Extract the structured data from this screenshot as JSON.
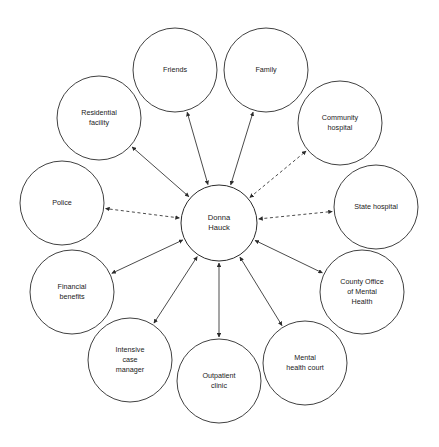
{
  "diagram": {
    "type": "ecomap",
    "center": {
      "id": "center",
      "lines": [
        "Donna",
        "Hauck"
      ],
      "cx": 219,
      "cy": 223,
      "r": 38
    },
    "nodes": [
      {
        "id": "friends",
        "lines": [
          "Friends"
        ],
        "cx": 175,
        "cy": 70,
        "r": 42
      },
      {
        "id": "family",
        "lines": [
          "Family"
        ],
        "cx": 266,
        "cy": 70,
        "r": 42
      },
      {
        "id": "residential",
        "lines": [
          "Residential",
          "facility"
        ],
        "cx": 99,
        "cy": 118,
        "r": 42
      },
      {
        "id": "community_hosp",
        "lines": [
          "Community",
          "hospital"
        ],
        "cx": 340,
        "cy": 123,
        "r": 42
      },
      {
        "id": "police",
        "lines": [
          "Police"
        ],
        "cx": 62,
        "cy": 203,
        "r": 42
      },
      {
        "id": "state_hosp",
        "lines": [
          "State hospital"
        ],
        "cx": 376,
        "cy": 207,
        "r": 42
      },
      {
        "id": "financial",
        "lines": [
          "Financial",
          "benefits"
        ],
        "cx": 72,
        "cy": 292,
        "r": 42
      },
      {
        "id": "county_office",
        "lines": [
          "County Office",
          "of Mental",
          "Health"
        ],
        "cx": 362,
        "cy": 292,
        "r": 42
      },
      {
        "id": "icm",
        "lines": [
          "Intensive",
          "case",
          "manager"
        ],
        "cx": 130,
        "cy": 360,
        "r": 42
      },
      {
        "id": "outpatient",
        "lines": [
          "Outpatient",
          "clinic"
        ],
        "cx": 219,
        "cy": 381,
        "r": 42
      },
      {
        "id": "mh_court",
        "lines": [
          "Mental",
          "health court"
        ],
        "cx": 305,
        "cy": 363,
        "r": 42
      }
    ],
    "links": [
      {
        "id": "link-friends",
        "from": "center",
        "to": "friends",
        "style": "solid",
        "arrows": "both"
      },
      {
        "id": "link-family",
        "from": "center",
        "to": "family",
        "style": "solid",
        "arrows": "both"
      },
      {
        "id": "link-residential",
        "from": "center",
        "to": "residential",
        "style": "solid",
        "arrows": "both"
      },
      {
        "id": "link-community-hosp",
        "from": "center",
        "to": "community_hosp",
        "style": "dashed",
        "arrows": "both"
      },
      {
        "id": "link-police",
        "from": "center",
        "to": "police",
        "style": "dashed",
        "arrows": "both"
      },
      {
        "id": "link-state-hosp",
        "from": "center",
        "to": "state_hosp",
        "style": "dashed",
        "arrows": "both"
      },
      {
        "id": "link-financial",
        "from": "center",
        "to": "financial",
        "style": "solid",
        "arrows": "both"
      },
      {
        "id": "link-county-office",
        "from": "center",
        "to": "county_office",
        "style": "solid",
        "arrows": "both"
      },
      {
        "id": "link-icm",
        "from": "center",
        "to": "icm",
        "style": "solid",
        "arrows": "both"
      },
      {
        "id": "link-outpatient",
        "from": "center",
        "to": "outpatient",
        "style": "solid",
        "arrows": "both"
      },
      {
        "id": "link-mh-court",
        "from": "center",
        "to": "mh_court",
        "style": "solid",
        "arrows": "both"
      }
    ],
    "colors": {
      "stroke": "#2b2b2b",
      "fill": "#ffffff",
      "text": "#1a1a1a",
      "background": "#ffffff"
    }
  }
}
